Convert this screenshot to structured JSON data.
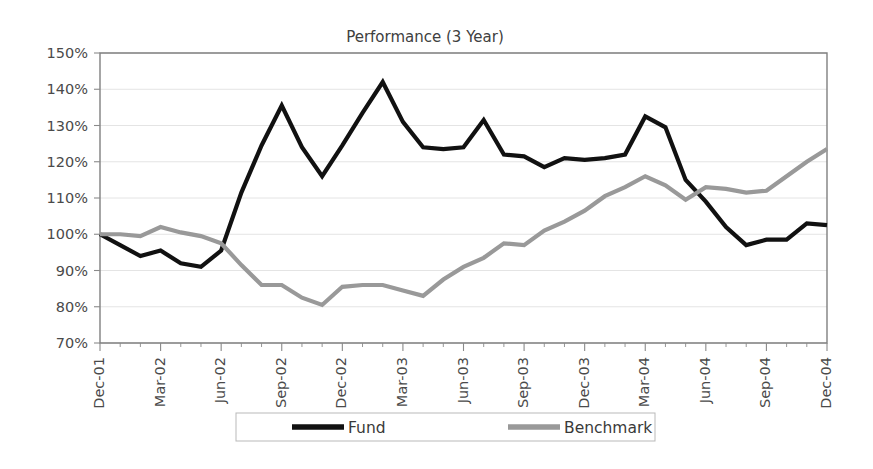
{
  "chart_data": {
    "type": "line",
    "title": "Performance (3 Year)",
    "xlabel": "",
    "ylabel": "",
    "ylim": [
      70,
      150
    ],
    "ytick_values": [
      70,
      80,
      90,
      100,
      110,
      120,
      130,
      140,
      150
    ],
    "ytick_labels": [
      "70%",
      "80%",
      "90%",
      "100%",
      "110%",
      "120%",
      "130%",
      "140%",
      "150%"
    ],
    "grid": true,
    "legend_position": "bottom",
    "x": [
      "Dec-01",
      "Jan-02",
      "Feb-02",
      "Mar-02",
      "Apr-02",
      "May-02",
      "Jun-02",
      "Jul-02",
      "Aug-02",
      "Sep-02",
      "Oct-02",
      "Nov-02",
      "Dec-02",
      "Jan-03",
      "Feb-03",
      "Mar-03",
      "Apr-03",
      "May-03",
      "Jun-03",
      "Jul-03",
      "Aug-03",
      "Sep-03",
      "Oct-03",
      "Nov-03",
      "Dec-03",
      "Jan-04",
      "Feb-04",
      "Mar-04",
      "Apr-04",
      "May-04",
      "Jun-04",
      "Jul-04",
      "Aug-04",
      "Sep-04",
      "Oct-04",
      "Nov-04",
      "Dec-04"
    ],
    "xtick_labels": [
      "Dec-01",
      "Mar-02",
      "Jun-02",
      "Sep-02",
      "Dec-02",
      "Mar-03",
      "Jun-03",
      "Sep-03",
      "Dec-03",
      "Mar-04",
      "Jun-04",
      "Sep-04",
      "Dec-04"
    ],
    "xtick_label_indices": [
      0,
      3,
      6,
      9,
      12,
      15,
      18,
      21,
      24,
      27,
      30,
      33,
      36
    ],
    "series": [
      {
        "name": "Fund",
        "color": "#111111",
        "width": 4.2,
        "values": [
          100.0,
          97.0,
          94.0,
          95.5,
          92.0,
          91.0,
          95.5,
          111.5,
          124.5,
          135.5,
          124.0,
          116.0,
          124.5,
          133.5,
          142.0,
          131.0,
          124.0,
          123.5,
          124.0,
          131.5,
          122.0,
          121.5,
          118.5,
          121.0,
          120.5,
          121.0,
          122.0,
          132.5,
          129.5,
          115.0,
          109.0,
          102.0,
          97.0,
          98.5,
          98.5,
          103.0,
          102.5
        ]
      },
      {
        "name": "Benchmark",
        "color": "#999999",
        "width": 4.2,
        "values": [
          100.0,
          100.0,
          99.5,
          102.0,
          100.5,
          99.5,
          97.5,
          91.5,
          86.0,
          86.0,
          82.5,
          80.5,
          85.5,
          86.0,
          86.0,
          84.5,
          83.0,
          87.5,
          91.0,
          93.5,
          97.5,
          97.0,
          101.0,
          103.5,
          106.5,
          110.5,
          113.0,
          116.0,
          113.5,
          109.5,
          113.0,
          112.5,
          111.5,
          112.0,
          116.0,
          120.0,
          123.5
        ]
      }
    ],
    "legend": [
      {
        "label": "Fund",
        "color": "#111111"
      },
      {
        "label": "Benchmark",
        "color": "#999999"
      }
    ]
  },
  "layout": {
    "plot_left": 100,
    "plot_right": 827,
    "plot_top": 53,
    "plot_bottom": 343,
    "title_x": 425,
    "title_y": 42,
    "legend_x": 236,
    "legend_y": 413,
    "legend_w": 419,
    "legend_h": 28
  }
}
